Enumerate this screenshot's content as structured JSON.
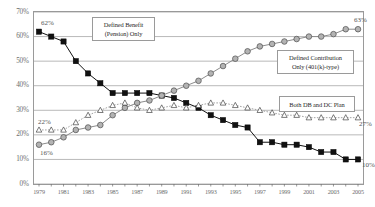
{
  "chart_data": {
    "type": "line",
    "title": "",
    "subtitle": "",
    "xlabel": "",
    "ylabel": "",
    "ylim": [
      0,
      70
    ],
    "ytick_labels": [
      "0%",
      "10%",
      "20%",
      "30%",
      "40%",
      "50%",
      "60%",
      "70%"
    ],
    "ytick_values": [
      0,
      10,
      20,
      30,
      40,
      50,
      60,
      70
    ],
    "grid": true,
    "legend_position": "inline-callout",
    "x": [
      1979,
      1980,
      1981,
      1982,
      1983,
      1984,
      1985,
      1986,
      1987,
      1988,
      1989,
      1990,
      1991,
      1992,
      1993,
      1994,
      1995,
      1996,
      1997,
      1998,
      1999,
      2000,
      2001,
      2002,
      2003,
      2004,
      2005
    ],
    "xtick_labels": [
      "1979",
      "1981",
      "1983",
      "1985",
      "1987",
      "1989",
      "1991",
      "1993",
      "1995",
      "1997",
      "1999",
      "2001",
      "2003",
      "2005"
    ],
    "xtick_values": [
      1979,
      1981,
      1983,
      1985,
      1987,
      1989,
      1991,
      1993,
      1995,
      1997,
      1999,
      2001,
      2003,
      2005
    ],
    "series": [
      {
        "name": "Defined Benefit (Pension) Only",
        "marker": "filled-square",
        "color": "#111111",
        "line_color": "#111111",
        "line_style": "solid",
        "values": [
          62,
          60,
          58,
          50,
          45,
          41,
          37,
          37,
          37,
          37,
          36,
          35,
          33,
          31,
          28,
          26,
          24,
          23,
          17,
          17,
          16,
          16,
          15,
          13,
          13,
          10,
          10
        ]
      },
      {
        "name": "Defined Contribution Only (401(k)-type)",
        "marker": "filled-circle",
        "color": "#b3b3b3",
        "line_color": "#8c8c8c",
        "line_style": "solid",
        "values": [
          16,
          17,
          19,
          22,
          23,
          24,
          28,
          31,
          33,
          34,
          36,
          38,
          40,
          42,
          45,
          48,
          51,
          54,
          56,
          57,
          58,
          59,
          60,
          60,
          61,
          63,
          63
        ]
      },
      {
        "name": "Both DB and DC Plan",
        "marker": "open-triangle",
        "color": "#ffffff",
        "line_color": "#8c8c8c",
        "line_style": "dotted",
        "values": [
          22,
          22,
          22,
          25,
          28,
          30,
          32,
          33,
          31,
          30,
          31,
          32,
          31,
          32,
          33,
          33,
          32,
          31,
          30,
          29,
          28,
          28,
          27,
          27,
          27,
          27,
          27
        ]
      }
    ],
    "annotations": [
      {
        "id": "db-start",
        "text": "62%",
        "series": "Defined Benefit (Pension) Only",
        "x": 1979,
        "y": 62
      },
      {
        "id": "db-end",
        "text": "10%",
        "series": "Defined Benefit (Pension) Only",
        "x": 2005,
        "y": 10
      },
      {
        "id": "dc-start",
        "text": "16%",
        "series": "Defined Contribution Only (401(k)-type)",
        "x": 1979,
        "y": 16
      },
      {
        "id": "dc-end",
        "text": "63%",
        "series": "Defined Contribution Only (401(k)-type)",
        "x": 2005,
        "y": 63
      },
      {
        "id": "both-start",
        "text": "22%",
        "series": "Both DB and DC Plan",
        "x": 1979,
        "y": 22
      },
      {
        "id": "both-end",
        "text": "27%",
        "series": "Both DB and DC Plan",
        "x": 2005,
        "y": 27
      }
    ],
    "callouts": [
      {
        "id": "callout-db",
        "line1": "Defined Benefit",
        "line2": "(Pension) Only"
      },
      {
        "id": "callout-dc",
        "line1": "Defined Contribution",
        "line2": "Only (401(k)-type)"
      },
      {
        "id": "callout-both",
        "line1": "Both DB and DC Plan",
        "line2": ""
      }
    ]
  }
}
